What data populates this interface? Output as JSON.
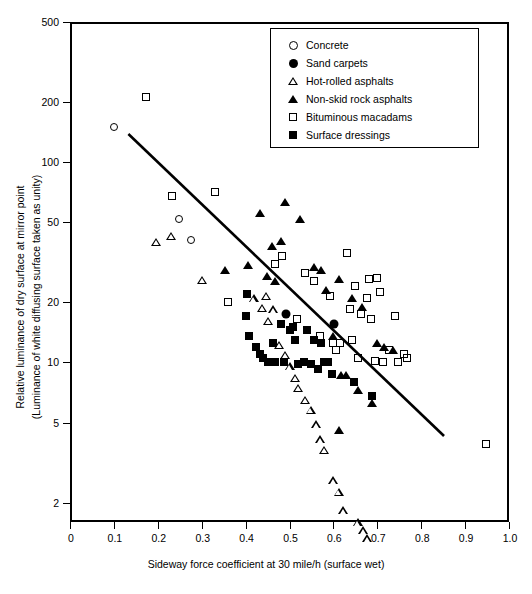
{
  "chart_data": {
    "type": "scatter",
    "title": "",
    "xlabel": "Sideway force coefficient at 30 mile/h (surface wet)",
    "ylabel_line1": "Relative luminance of dry surface at mirror point",
    "ylabel_line2": "(Luminance of white diffusing surface taken as unity)",
    "xscale": "linear",
    "yscale": "log",
    "xlim": [
      0,
      1.0
    ],
    "ylim": [
      1.6,
      500
    ],
    "grid": false,
    "xticks": [
      "0",
      "0.1",
      "0.2",
      "0.3",
      "0.4",
      "0.5",
      "0.6",
      "0.7",
      "0.8",
      "0.9",
      "1.0"
    ],
    "xtick_values": [
      0,
      0.1,
      0.2,
      0.3,
      0.4,
      0.5,
      0.6,
      0.7,
      0.8,
      0.9,
      1.0
    ],
    "yticks": [
      "500",
      "200",
      "100",
      "50",
      "20",
      "10",
      "5",
      "2"
    ],
    "ytick_values": [
      500,
      200,
      100,
      50,
      20,
      10,
      5,
      2
    ],
    "legend_position": "top-right",
    "trendline": {
      "name": "fitted regression line",
      "x_start": 0.133,
      "y_start": 138.0,
      "x_end": 0.852,
      "y_end": 4.3
    },
    "series": [
      {
        "name": "Concrete",
        "marker": "circle-open",
        "points": [
          [
            0.1,
            150.0
          ],
          [
            0.248,
            52.0
          ],
          [
            0.276,
            41.0
          ]
        ]
      },
      {
        "name": "Sand carpets",
        "marker": "circle-filled",
        "points": [
          [
            0.492,
            17.5
          ],
          [
            0.601,
            15.5
          ]
        ]
      },
      {
        "name": "Hot-rolled asphalts",
        "marker": "triangle-open",
        "points": [
          [
            0.196,
            40.0
          ],
          [
            0.23,
            47.0
          ],
          [
            0.3,
            31.0
          ],
          [
            0.418,
            27.5
          ],
          [
            0.438,
            27.0
          ],
          [
            0.447,
            34.0
          ],
          [
            0.452,
            28.0
          ],
          [
            0.462,
            35.0
          ],
          [
            0.476,
            25.5
          ],
          [
            0.49,
            25.0
          ],
          [
            0.5,
            24.0
          ],
          [
            0.512,
            23.0
          ],
          [
            0.52,
            22.5
          ],
          [
            0.536,
            21.5
          ],
          [
            0.548,
            21.0
          ],
          [
            0.56,
            19.5
          ],
          [
            0.57,
            18.0
          ],
          [
            0.578,
            17.5
          ],
          [
            0.6,
            13.5
          ],
          [
            0.612,
            13.0
          ],
          [
            0.622,
            11.5
          ],
          [
            0.655,
            11.0
          ],
          [
            0.668,
            11.0
          ],
          [
            0.676,
            11.0
          ]
        ]
      },
      {
        "name": "Non-skid rock asphalts",
        "marker": "triangle-filled",
        "points": [
          [
            0.352,
            29.0
          ],
          [
            0.405,
            30.5
          ],
          [
            0.432,
            56.0
          ],
          [
            0.448,
            27.0
          ],
          [
            0.46,
            38.0
          ],
          [
            0.468,
            25.5
          ],
          [
            0.48,
            40.5
          ],
          [
            0.49,
            63.0
          ],
          [
            0.524,
            52.0
          ],
          [
            0.556,
            30.0
          ],
          [
            0.572,
            29.0
          ],
          [
            0.584,
            23.0
          ],
          [
            0.6,
            13.5
          ],
          [
            0.612,
            26.0
          ],
          [
            0.618,
            8.7
          ],
          [
            0.628,
            8.7
          ],
          [
            0.642,
            21.0
          ],
          [
            0.656,
            7.3
          ],
          [
            0.666,
            19.0
          ],
          [
            0.688,
            6.3
          ],
          [
            0.7,
            12.5
          ],
          [
            0.716,
            12.0
          ],
          [
            0.612,
            4.6
          ],
          [
            0.736,
            11.5
          ]
        ]
      },
      {
        "name": "Bituminous macadams",
        "marker": "square-open",
        "points": [
          [
            0.172,
            212.0
          ],
          [
            0.232,
            68.0
          ],
          [
            0.33,
            71.0
          ],
          [
            0.36,
            20.0
          ],
          [
            0.468,
            31.0
          ],
          [
            0.482,
            34.0
          ],
          [
            0.516,
            16.5
          ],
          [
            0.536,
            28.0
          ],
          [
            0.556,
            25.5
          ],
          [
            0.57,
            13.5
          ],
          [
            0.592,
            21.5
          ],
          [
            0.6,
            12.5
          ],
          [
            0.606,
            11.5
          ],
          [
            0.616,
            12.5
          ],
          [
            0.63,
            35.0
          ],
          [
            0.638,
            18.5
          ],
          [
            0.642,
            13.0
          ],
          [
            0.65,
            24.0
          ],
          [
            0.656,
            10.5
          ],
          [
            0.664,
            17.5
          ],
          [
            0.676,
            21.0
          ],
          [
            0.68,
            26.0
          ],
          [
            0.686,
            16.5
          ],
          [
            0.694,
            10.2
          ],
          [
            0.7,
            26.5
          ],
          [
            0.706,
            22.5
          ],
          [
            0.712,
            10.0
          ],
          [
            0.726,
            11.5
          ],
          [
            0.74,
            17.0
          ],
          [
            0.748,
            10.0
          ],
          [
            0.76,
            11.0
          ],
          [
            0.768,
            10.5
          ],
          [
            0.948,
            3.9
          ]
        ]
      },
      {
        "name": "Surface dressings",
        "marker": "square-filled",
        "points": [
          [
            0.402,
            17.0
          ],
          [
            0.404,
            22.0
          ],
          [
            0.408,
            13.5
          ],
          [
            0.424,
            12.0
          ],
          [
            0.432,
            11.0
          ],
          [
            0.44,
            10.5
          ],
          [
            0.452,
            10.0
          ],
          [
            0.462,
            12.5
          ],
          [
            0.468,
            10.0
          ],
          [
            0.48,
            15.5
          ],
          [
            0.488,
            10.0
          ],
          [
            0.5,
            14.5
          ],
          [
            0.508,
            15.0
          ],
          [
            0.512,
            13.0
          ],
          [
            0.52,
            9.8
          ],
          [
            0.532,
            10.0
          ],
          [
            0.54,
            14.5
          ],
          [
            0.548,
            9.8
          ],
          [
            0.556,
            13.0
          ],
          [
            0.566,
            9.3
          ],
          [
            0.572,
            12.5
          ],
          [
            0.578,
            10.0
          ],
          [
            0.588,
            10.0
          ],
          [
            0.596,
            8.8
          ],
          [
            0.648,
            8.0
          ],
          [
            0.688,
            6.8
          ]
        ]
      }
    ]
  },
  "legend": {
    "items": [
      {
        "label": "Concrete",
        "marker": "circle-open"
      },
      {
        "label": "Sand carpets",
        "marker": "circle-filled"
      },
      {
        "label": "Hot-rolled asphalts",
        "marker": "triangle-open"
      },
      {
        "label": "Non-skid rock asphalts",
        "marker": "triangle-filled"
      },
      {
        "label": "Bituminous macadams",
        "marker": "square-open"
      },
      {
        "label": "Surface dressings",
        "marker": "square-filled"
      }
    ]
  }
}
